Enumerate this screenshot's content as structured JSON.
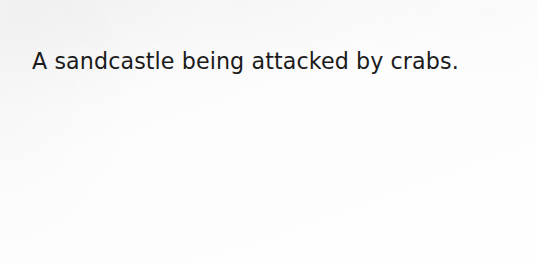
{
  "image": {
    "background_color": "#fdfdfd",
    "text_color": "#1b1b1b"
  },
  "caption": {
    "text": "A sandcastle being attacked by crabs."
  }
}
